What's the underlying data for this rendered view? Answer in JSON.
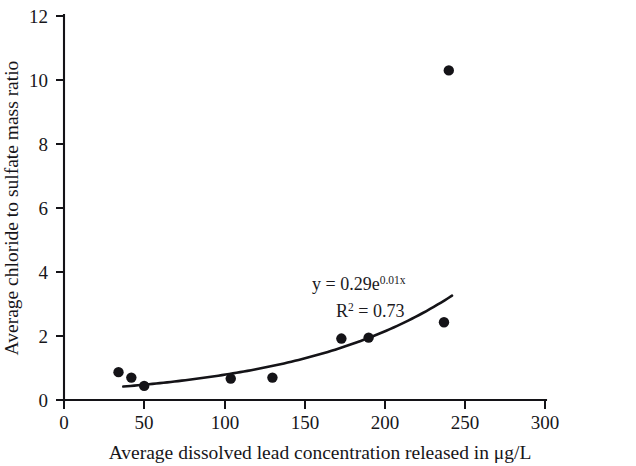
{
  "chart_data": {
    "type": "scatter",
    "title": "",
    "xlabel": "Average dissolved lead concentration released in μg/L",
    "ylabel": "Average chloride to sulfate mass ratio",
    "xlim": [
      0,
      300
    ],
    "ylim": [
      0,
      12
    ],
    "xticks": [
      0,
      50,
      100,
      150,
      200,
      250,
      300
    ],
    "xtick_labels": [
      "0",
      "50",
      "100",
      "150",
      "200",
      "250",
      "300"
    ],
    "yticks": [
      0,
      2,
      4,
      6,
      8,
      10,
      12
    ],
    "ytick_labels": [
      "0",
      "2",
      "4",
      "6",
      "8",
      "10",
      "12"
    ],
    "grid": false,
    "legend": null,
    "points": [
      {
        "x": 34,
        "y": 0.87
      },
      {
        "x": 42,
        "y": 0.7
      },
      {
        "x": 50,
        "y": 0.44
      },
      {
        "x": 104,
        "y": 0.67
      },
      {
        "x": 130,
        "y": 0.7
      },
      {
        "x": 173,
        "y": 1.92
      },
      {
        "x": 190,
        "y": 1.95
      },
      {
        "x": 237,
        "y": 2.43
      },
      {
        "x": 240,
        "y": 10.3
      }
    ],
    "trendline": {
      "type": "exponential",
      "coefficient": 0.29,
      "exponent_rate": 0.01,
      "x_start": 37,
      "x_end": 242,
      "r_squared": 0.73
    },
    "annotations": {
      "equation_prefix": "y = 0.29e",
      "equation_exponent": "0.01x",
      "r2_label": "R",
      "r2_sup": "2",
      "r2_value": " = 0.73"
    },
    "colors": {
      "marker": "#141317",
      "line": "#141317",
      "axis": "#141317",
      "text": "#17161a",
      "background": "#ffffff"
    }
  }
}
